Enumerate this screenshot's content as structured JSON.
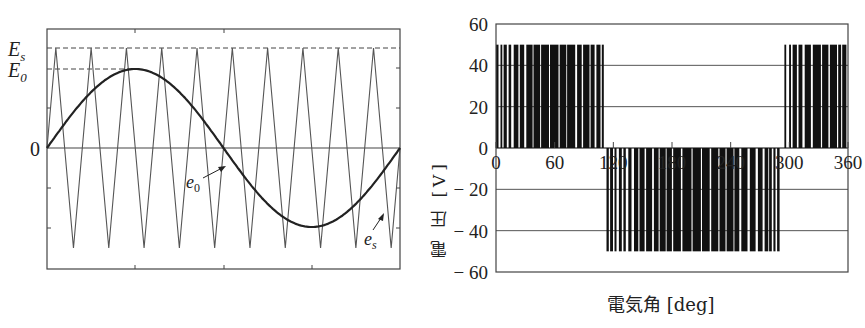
{
  "chart_data": [
    {
      "type": "line",
      "title": "",
      "description": "PWM carrier comparison: sinusoidal reference e0 vs triangular carrier es",
      "xlabel": "",
      "ylabel": "",
      "y_tick_labels": [
        "E_s",
        "E_0",
        "0"
      ],
      "series": [
        {
          "name": "e0",
          "kind": "sine",
          "amplitude_label": "E0",
          "amplitude_rel": 0.83,
          "periods": 1
        },
        {
          "name": "es",
          "kind": "triangle",
          "amplitude_label": "Es",
          "amplitude_rel": 1.0,
          "cycles": 10
        }
      ],
      "annotations": [
        "e0",
        "es"
      ],
      "grid": false
    },
    {
      "type": "bar",
      "title": "",
      "xlabel": "電気角 [deg]",
      "ylabel": "電 圧 [V]",
      "xlim": [
        0,
        360
      ],
      "ylim": [
        -60,
        60
      ],
      "x_ticks": [
        0,
        60,
        120,
        180,
        240,
        300,
        360
      ],
      "y_ticks": [
        60,
        40,
        20,
        0,
        -20,
        -40,
        -60
      ],
      "grid": true,
      "description": "PWM output voltage pulses",
      "pulse_amplitude": 50,
      "segments": [
        {
          "from": 0,
          "to": 113,
          "level": 50
        },
        {
          "from": 113,
          "to": 290,
          "level": -50
        },
        {
          "from": 295,
          "to": 360,
          "level": 50
        }
      ]
    }
  ],
  "left": {
    "labels": {
      "es_axis": "E",
      "es_sub": "s",
      "e0_axis": "E",
      "e0_sub": "0",
      "zero": "0",
      "e0_curve": "e",
      "e0_curve_sub": "0",
      "es_curve": "e",
      "es_curve_sub": "s"
    }
  },
  "right": {
    "ylabel": "電 圧 [V]",
    "xlabel": "電気角 [deg]",
    "y_tick_labels": [
      "60",
      "40",
      "20",
      "0",
      "− 20",
      "− 40",
      "− 60"
    ],
    "x_tick_labels": [
      "0",
      "60",
      "120",
      "180",
      "240",
      "300",
      "360"
    ]
  }
}
